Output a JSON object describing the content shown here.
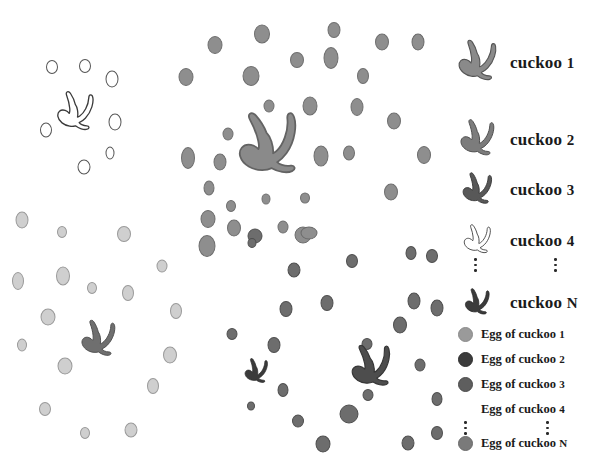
{
  "figure": {
    "title_visible": false,
    "background": "#ffffff"
  },
  "palette": {
    "cuckoo_1": "#8a8a8a",
    "cuckoo_2": "#6f6f6f",
    "cuckoo_3": "#4d4d4d",
    "cuckoo_4": "#ffffff",
    "cuckoo_4_outline": "#3a3a3a",
    "cuckoo_N": "#3b3b3b",
    "egg_1": "#9a9a9a",
    "egg_2": "#3c3c3c",
    "egg_3": "#5e5e5e",
    "egg_4": "#ffffff",
    "egg_4_outline": "#9b9b9b",
    "egg_N": "#7a7a7a",
    "egg_light": "#cfcfcf",
    "egg_light_outline": "#9a9a9a",
    "dots": "#2b2b2b"
  },
  "legend": {
    "birds": [
      {
        "label": "cuckoo",
        "number": "1",
        "color": "#8a8a8a",
        "outline": "#555555",
        "icon": "bird-icon",
        "size": 88,
        "x": 6,
        "y": 4
      },
      {
        "label": "cuckoo",
        "number": "2",
        "color": "#7c7c7c",
        "outline": "#4f4f4f",
        "icon": "bird-icon",
        "size": 56,
        "x": 22,
        "y": 100
      },
      {
        "label": "cuckoo",
        "number": "3",
        "color": "#585858",
        "outline": "#333333",
        "icon": "bird-icon",
        "size": 48,
        "x": 26,
        "y": 155
      },
      {
        "label": "cuckoo",
        "number": "4",
        "color": "#ffffff",
        "outline": "#3a3a3a",
        "icon": "bird-icon",
        "size": 44,
        "x": 28,
        "y": 212
      },
      {
        "label": "cuckoo",
        "number": "N",
        "color": "#3b3b3b",
        "outline": "#222222",
        "icon": "bird-icon",
        "size": 40,
        "x": 30,
        "y": 282
      }
    ],
    "bird_rows": [
      {
        "label": "cuckoo 1",
        "name": "cuckoo",
        "num": "1",
        "top": 52
      },
      {
        "label": "cuckoo 2",
        "name": "cuckoo",
        "num": "2",
        "top": 127
      },
      {
        "label": "cuckoo 3",
        "name": "cuckoo",
        "num": "3",
        "top": 180
      },
      {
        "label": "cuckoo 4",
        "name": "cuckoo",
        "num": "4",
        "top": 234
      },
      {
        "label": "cuckoo N",
        "name": "cuckoo",
        "num": "N",
        "top": 297
      }
    ],
    "eggs": [
      {
        "label": "Egg of cuckoo",
        "num": "1",
        "color": "#9a9a9a",
        "outline": "#8a8a8a",
        "top": 334
      },
      {
        "label": "Egg of cuckoo",
        "num": "2",
        "color": "#3c3c3c",
        "outline": "#2e2e2e",
        "top": 359
      },
      {
        "label": "Egg of cuckoo",
        "num": "3",
        "color": "#5e5e5e",
        "outline": "#4a4a4a",
        "top": 384
      },
      {
        "label": "Egg of cuckoo",
        "num": "4",
        "color": "#ffffff",
        "outline": "#ffffff",
        "top": 409
      },
      {
        "label": "Egg of cuckoo",
        "num": "N",
        "color": "#7a7a7a",
        "outline": "#6a6a6a",
        "top": 443
      }
    ],
    "ellipsis_bird": {
      "left_x": 22,
      "right_x": 102,
      "y": 262
    },
    "ellipsis_egg": {
      "left_x": 16,
      "right_x": 96,
      "y": 426
    }
  },
  "chart_data": {
    "type": "scatter",
    "title": "",
    "xlabel": "",
    "ylabel": "",
    "legend_position": "right",
    "grid": false,
    "series": [
      {
        "name": "cuckoo 1",
        "marker": "bird",
        "color": "#8a8a8a",
        "birds": [
          {
            "x": 268,
            "y": 147,
            "size": 100,
            "rot": -8
          }
        ],
        "egg_color": "#8e8e8e",
        "egg_outline": "#6f6f6f",
        "eggs": [
          {
            "x": 215,
            "y": 45,
            "w": 15,
            "h": 18
          },
          {
            "x": 262,
            "y": 34,
            "w": 16,
            "h": 19
          },
          {
            "x": 334,
            "y": 30,
            "w": 13,
            "h": 16
          },
          {
            "x": 382,
            "y": 42,
            "w": 14,
            "h": 17
          },
          {
            "x": 186,
            "y": 77,
            "w": 15,
            "h": 18
          },
          {
            "x": 251,
            "y": 76,
            "w": 17,
            "h": 20
          },
          {
            "x": 297,
            "y": 60,
            "w": 14,
            "h": 16
          },
          {
            "x": 331,
            "y": 58,
            "w": 15,
            "h": 22
          },
          {
            "x": 363,
            "y": 76,
            "w": 12,
            "h": 16
          },
          {
            "x": 269,
            "y": 106,
            "w": 11,
            "h": 13
          },
          {
            "x": 310,
            "y": 106,
            "w": 15,
            "h": 19
          },
          {
            "x": 357,
            "y": 107,
            "w": 13,
            "h": 18
          },
          {
            "x": 394,
            "y": 121,
            "w": 14,
            "h": 17
          },
          {
            "x": 228,
            "y": 134,
            "w": 11,
            "h": 13
          },
          {
            "x": 220,
            "y": 162,
            "w": 13,
            "h": 17
          },
          {
            "x": 188,
            "y": 158,
            "w": 14,
            "h": 22
          },
          {
            "x": 321,
            "y": 156,
            "w": 15,
            "h": 21
          },
          {
            "x": 349,
            "y": 153,
            "w": 12,
            "h": 15
          },
          {
            "x": 391,
            "y": 192,
            "w": 14,
            "h": 17
          },
          {
            "x": 209,
            "y": 188,
            "w": 11,
            "h": 15
          },
          {
            "x": 266,
            "y": 199,
            "w": 9,
            "h": 11
          },
          {
            "x": 231,
            "y": 206,
            "w": 10,
            "h": 12
          },
          {
            "x": 305,
            "y": 198,
            "w": 10,
            "h": 11
          },
          {
            "x": 303,
            "y": 235,
            "w": 17,
            "h": 17
          },
          {
            "x": 234,
            "y": 228,
            "w": 14,
            "h": 17
          },
          {
            "x": 283,
            "y": 227,
            "w": 11,
            "h": 13
          },
          {
            "x": 207,
            "y": 246,
            "w": 17,
            "h": 22
          }
        ]
      },
      {
        "name": "cuckoo 2",
        "marker": "bird",
        "color": "#6f6f6f",
        "birds": [
          {
            "x": 98,
            "y": 340,
            "size": 56,
            "rot": 0
          }
        ],
        "egg_color": "#cfcfcf",
        "egg_outline": "#9a9a9a",
        "eggs": [
          {
            "x": 22,
            "y": 220,
            "w": 13,
            "h": 17
          },
          {
            "x": 62,
            "y": 232,
            "w": 10,
            "h": 12
          },
          {
            "x": 124,
            "y": 234,
            "w": 14,
            "h": 16
          },
          {
            "x": 18,
            "y": 281,
            "w": 12,
            "h": 18
          },
          {
            "x": 63,
            "y": 276,
            "w": 14,
            "h": 19
          },
          {
            "x": 92,
            "y": 288,
            "w": 10,
            "h": 12
          },
          {
            "x": 128,
            "y": 293,
            "w": 12,
            "h": 16
          },
          {
            "x": 162,
            "y": 266,
            "w": 11,
            "h": 13
          },
          {
            "x": 176,
            "y": 311,
            "w": 12,
            "h": 16
          },
          {
            "x": 48,
            "y": 317,
            "w": 15,
            "h": 17
          },
          {
            "x": 22,
            "y": 345,
            "w": 10,
            "h": 13
          },
          {
            "x": 65,
            "y": 366,
            "w": 15,
            "h": 17
          },
          {
            "x": 170,
            "y": 355,
            "w": 14,
            "h": 17
          },
          {
            "x": 153,
            "y": 386,
            "w": 12,
            "h": 16
          },
          {
            "x": 45,
            "y": 409,
            "w": 12,
            "h": 14
          },
          {
            "x": 85,
            "y": 433,
            "w": 10,
            "h": 12
          },
          {
            "x": 131,
            "y": 430,
            "w": 13,
            "h": 15
          }
        ]
      },
      {
        "name": "cuckoo 3",
        "marker": "bird",
        "color": "#4d4d4d",
        "birds": [
          {
            "x": 371,
            "y": 368,
            "size": 66,
            "rot": -6
          }
        ],
        "egg_color": "#6d6d6d",
        "egg_outline": "#4f4f4f",
        "eggs": [
          {
            "x": 255,
            "y": 236,
            "w": 15,
            "h": 15
          },
          {
            "x": 252,
            "y": 243,
            "w": 9,
            "h": 10
          },
          {
            "x": 352,
            "y": 261,
            "w": 12,
            "h": 14
          },
          {
            "x": 411,
            "y": 253,
            "w": 11,
            "h": 14
          },
          {
            "x": 432,
            "y": 256,
            "w": 12,
            "h": 14
          },
          {
            "x": 294,
            "y": 270,
            "w": 13,
            "h": 15
          },
          {
            "x": 327,
            "y": 303,
            "w": 13,
            "h": 16
          },
          {
            "x": 286,
            "y": 309,
            "w": 13,
            "h": 16
          },
          {
            "x": 414,
            "y": 301,
            "w": 13,
            "h": 17
          },
          {
            "x": 437,
            "y": 308,
            "w": 13,
            "h": 17
          },
          {
            "x": 400,
            "y": 325,
            "w": 14,
            "h": 17
          },
          {
            "x": 232,
            "y": 334,
            "w": 11,
            "h": 12
          },
          {
            "x": 274,
            "y": 345,
            "w": 13,
            "h": 16
          },
          {
            "x": 367,
            "y": 344,
            "w": 11,
            "h": 12
          },
          {
            "x": 420,
            "y": 365,
            "w": 11,
            "h": 13
          },
          {
            "x": 283,
            "y": 390,
            "w": 11,
            "h": 14
          },
          {
            "x": 368,
            "y": 395,
            "w": 11,
            "h": 12
          },
          {
            "x": 437,
            "y": 399,
            "w": 11,
            "h": 14
          },
          {
            "x": 251,
            "y": 406,
            "w": 8,
            "h": 9
          },
          {
            "x": 298,
            "y": 421,
            "w": 12,
            "h": 13
          },
          {
            "x": 349,
            "y": 414,
            "w": 19,
            "h": 19
          },
          {
            "x": 323,
            "y": 444,
            "w": 15,
            "h": 17
          },
          {
            "x": 408,
            "y": 443,
            "w": 13,
            "h": 15
          },
          {
            "x": 437,
            "y": 433,
            "w": 12,
            "h": 14
          }
        ]
      },
      {
        "name": "cuckoo 4",
        "marker": "bird-outline",
        "color": "#ffffff",
        "birds": [
          {
            "x": 75,
            "y": 113,
            "size": 60,
            "rot": 0
          }
        ],
        "egg_color": "#ffffff",
        "egg_outline": "#555555",
        "eggs": [
          {
            "x": 52,
            "y": 67,
            "w": 12,
            "h": 14
          },
          {
            "x": 85,
            "y": 66,
            "w": 12,
            "h": 14
          },
          {
            "x": 112,
            "y": 79,
            "w": 13,
            "h": 17
          },
          {
            "x": 46,
            "y": 130,
            "w": 12,
            "h": 15
          },
          {
            "x": 115,
            "y": 122,
            "w": 13,
            "h": 17
          },
          {
            "x": 110,
            "y": 153,
            "w": 9,
            "h": 13
          },
          {
            "x": 84,
            "y": 167,
            "w": 13,
            "h": 15
          }
        ]
      },
      {
        "name": "cuckoo N",
        "marker": "bird",
        "color": "#3b3b3b",
        "birds": [
          {
            "x": 256,
            "y": 372,
            "size": 38,
            "rot": 0
          }
        ],
        "egg_color": "#8e8e8e",
        "egg_outline": "#6a6a6a",
        "eggs": [
          {
            "x": 309,
            "y": 233,
            "w": 17,
            "h": 13
          },
          {
            "x": 208,
            "y": 219,
            "w": 15,
            "h": 18
          },
          {
            "x": 424,
            "y": 155,
            "w": 14,
            "h": 18
          },
          {
            "x": 418,
            "y": 42,
            "w": 13,
            "h": 17
          }
        ]
      }
    ]
  }
}
